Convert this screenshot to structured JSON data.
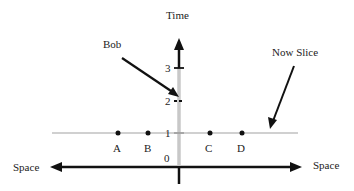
{
  "diagram": {
    "axes": {
      "time_label": "Time",
      "space_left_label": "Space",
      "space_right_label": "Space"
    },
    "ticks": [
      {
        "label": "3",
        "value": 3
      },
      {
        "label": "2",
        "value": 2
      },
      {
        "label": "1",
        "value": 1
      },
      {
        "label": "0",
        "value": 0
      }
    ],
    "points": [
      {
        "label": "A"
      },
      {
        "label": "B"
      },
      {
        "label": "C"
      },
      {
        "label": "D"
      }
    ],
    "annotations": {
      "bob": "Bob",
      "now_slice": "Now Slice"
    },
    "colors": {
      "axis": "#111111",
      "worldline_gray": "#c8c8c8",
      "now_slice_gray": "#d0d0d0",
      "text": "#222222"
    }
  }
}
